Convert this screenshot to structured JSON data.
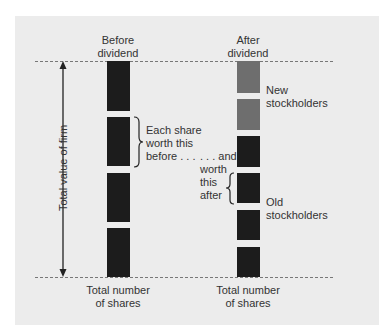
{
  "labels": {
    "before_title": [
      "Before",
      "dividend"
    ],
    "after_title": [
      "After",
      "dividend"
    ],
    "axis_label": "Total value of firm",
    "each_share": [
      "Each share",
      "worth this",
      "before . . ."
    ],
    "and_worth": [
      ". . . and",
      "worth",
      "this",
      "after"
    ],
    "new_stockholders": [
      "New",
      "stockholders"
    ],
    "old_stockholders": [
      "Old",
      "stockholders"
    ],
    "total_shares_left": [
      "Total number",
      "of shares"
    ],
    "total_shares_right": [
      "Total number",
      "of shares"
    ]
  },
  "colors": {
    "panel": "#ececec",
    "old_share": "#1c1c1c",
    "new_share": "#6e6e6e",
    "dash": "#777777"
  },
  "before_blocks": [
    {
      "top": 61,
      "height": 50,
      "type": "old"
    },
    {
      "top": 117,
      "height": 49,
      "type": "old"
    },
    {
      "top": 173,
      "height": 49,
      "type": "old"
    },
    {
      "top": 228,
      "height": 49,
      "type": "old"
    }
  ],
  "after_blocks": [
    {
      "top": 61,
      "height": 32,
      "type": "new"
    },
    {
      "top": 99,
      "height": 31,
      "type": "new"
    },
    {
      "top": 136,
      "height": 31,
      "type": "old"
    },
    {
      "top": 173,
      "height": 30,
      "type": "old"
    },
    {
      "top": 210,
      "height": 30,
      "type": "old"
    },
    {
      "top": 247,
      "height": 30,
      "type": "old"
    }
  ]
}
